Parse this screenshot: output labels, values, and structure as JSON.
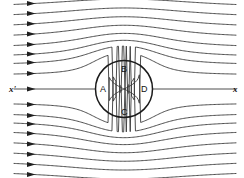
{
  "figure": {
    "axis_labels": {
      "left": "x'",
      "right": "x"
    },
    "point_labels": {
      "A": "A",
      "B": "B",
      "C": "C",
      "D": "D"
    },
    "colors": {
      "background": "#ffffff",
      "streamline": "#3a3a3a",
      "cylinder": "#1a1a1a",
      "arrow": "#202020",
      "text": "#111111"
    }
  },
  "chart_data": {
    "type": "line",
    "xlabel": "",
    "ylabel": "",
    "xlim": [
      0,
      244
    ],
    "ylim": [
      0,
      178
    ],
    "grid": false,
    "legend": null,
    "cylinder": {
      "center_x": 124,
      "center_y": 89,
      "radius": 28.5,
      "marked_points": [
        {
          "label": "A",
          "position": "left",
          "x": 95.5,
          "y": 89
        },
        {
          "label": "B",
          "position": "top",
          "x": 124,
          "y": 60.5
        },
        {
          "label": "C",
          "position": "bottom",
          "x": 124,
          "y": 117.5
        },
        {
          "label": "D",
          "position": "right",
          "x": 152.5,
          "y": 89
        }
      ]
    },
    "axis_line": {
      "y": 89,
      "x_start": 10,
      "x_end": 234,
      "left_label": "x'",
      "right_label": "x"
    },
    "streamlines": {
      "count": 17,
      "inlet_x": 14,
      "outlet_x": 236,
      "arrow_x": 33,
      "inlet_y_values": [
        8,
        18,
        28,
        38,
        48,
        57,
        65,
        75,
        89,
        103,
        113,
        121,
        130,
        140,
        150,
        160,
        170
      ],
      "description": "Uniform left-to-right flow deflected symmetrically around a circular cylinder; arrowheads at the inlet indicate flow direction; the central streamline is the stagnation streamline meeting the cylinder at A and D."
    }
  }
}
